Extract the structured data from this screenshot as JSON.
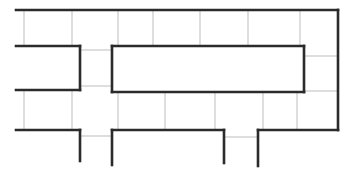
{
  "diagram": {
    "type": "maze-floor-plan",
    "canvas": {
      "width": 352,
      "height": 174
    },
    "colors": {
      "background": "#ffffff",
      "wall": "#2b2b2b",
      "grid": "#bdbdbd"
    },
    "wall_thickness": 2.6,
    "grid_thickness": 1,
    "walls": [
      [
        16,
        10,
        338,
        10
      ],
      [
        338,
        10,
        338,
        130
      ],
      [
        16,
        46,
        80,
        46
      ],
      [
        80,
        46,
        80,
        90
      ],
      [
        16,
        90,
        80,
        90
      ],
      [
        112,
        46,
        304,
        46
      ],
      [
        304,
        46,
        304,
        92
      ],
      [
        112,
        92,
        304,
        92
      ],
      [
        112,
        46,
        112,
        92
      ],
      [
        16,
        130,
        80,
        130
      ],
      [
        80,
        130,
        80,
        161
      ],
      [
        112,
        130,
        112,
        165
      ],
      [
        112,
        130,
        224,
        130
      ],
      [
        224,
        130,
        224,
        163
      ],
      [
        258,
        130,
        258,
        166
      ],
      [
        258,
        130,
        338,
        130
      ]
    ],
    "grid_lines": [
      [
        24,
        10,
        24,
        46
      ],
      [
        72,
        10,
        72,
        46
      ],
      [
        118,
        10,
        118,
        46
      ],
      [
        153,
        10,
        153,
        46
      ],
      [
        200,
        10,
        200,
        46
      ],
      [
        248,
        10,
        248,
        46
      ],
      [
        300,
        10,
        300,
        46
      ],
      [
        24,
        90,
        24,
        130
      ],
      [
        72,
        90,
        72,
        130
      ],
      [
        118,
        92,
        118,
        130
      ],
      [
        165,
        92,
        165,
        130
      ],
      [
        215,
        92,
        215,
        130
      ],
      [
        263,
        92,
        263,
        130
      ],
      [
        297,
        92,
        297,
        130
      ],
      [
        80,
        50,
        112,
        50
      ],
      [
        80,
        86,
        112,
        86
      ],
      [
        305,
        56,
        338,
        56
      ],
      [
        305,
        91,
        338,
        91
      ],
      [
        80,
        136,
        112,
        136
      ],
      [
        224,
        137,
        258,
        137
      ]
    ]
  }
}
